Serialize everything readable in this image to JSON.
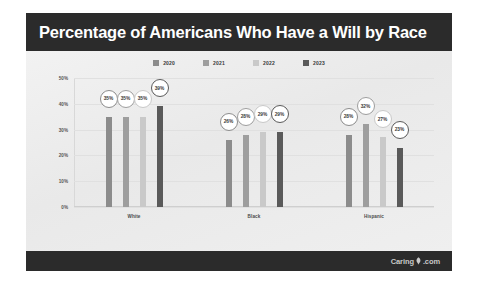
{
  "header": {
    "title": "Percentage of Americans Who Have a Will by Race"
  },
  "footer": {
    "watermark_pre": "Caring",
    "watermark_post": ".com",
    "leaf_icon": "leaf-icon"
  },
  "colors": {
    "header_band": "#2b2b2b",
    "footer_band": "#2b2b2b",
    "plot_background": "#efefef",
    "gridline": "#e0e0e0",
    "series_2020": "#8c8c8c",
    "series_2021": "#9e9e9e",
    "series_2022": "#c9c9c9",
    "series_2023": "#5a5a5a",
    "bubble_fill": "#ffffff",
    "bubble_text": "#3b3b3b"
  },
  "chart_data": {
    "type": "bar",
    "title": "Percentage of Americans Who Have a Will by Race",
    "xlabel": "",
    "ylabel": "",
    "ylim": [
      0,
      50
    ],
    "ytick_labels": [
      "50%",
      "40%",
      "30%",
      "20%",
      "10%",
      "0%"
    ],
    "ytick_values": [
      50,
      40,
      30,
      20,
      10,
      0
    ],
    "grid": true,
    "legend_position": "top-center",
    "categories": [
      "White",
      "Black",
      "Hispanic"
    ],
    "series": [
      {
        "name": "2020",
        "color": "#8c8c8c",
        "values": [
          35,
          26,
          28
        ],
        "labels": [
          "35%",
          "26%",
          "28%"
        ]
      },
      {
        "name": "2021",
        "color": "#9e9e9e",
        "values": [
          35,
          28,
          32
        ],
        "labels": [
          "35%",
          "28%",
          "32%"
        ]
      },
      {
        "name": "2022",
        "color": "#c9c9c9",
        "values": [
          35,
          29,
          27
        ],
        "labels": [
          "35%",
          "29%",
          "27%"
        ]
      },
      {
        "name": "2023",
        "color": "#5a5a5a",
        "values": [
          39,
          29,
          23
        ],
        "labels": [
          "39%",
          "29%",
          "23%"
        ]
      }
    ]
  }
}
